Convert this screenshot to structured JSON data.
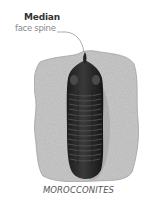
{
  "annotation": {
    "title": "Median",
    "subtitle": "face spine"
  },
  "specimen": {
    "caption": "MOROCCONITES"
  },
  "colors": {
    "slab": "#c9c9c9",
    "fossil": "#2a2a2a",
    "leader_line": "#8a8a8a"
  }
}
